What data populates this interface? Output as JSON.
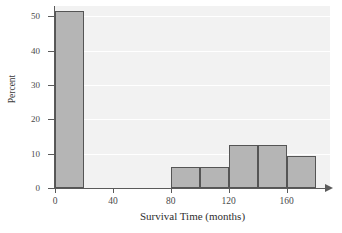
{
  "chart_data": {
    "type": "bar",
    "title": "",
    "xlabel": "Survival Time (months)",
    "ylabel": "Percent",
    "xlim": [
      0,
      190
    ],
    "ylim": [
      0,
      53
    ],
    "grid": true,
    "legend": "none",
    "x_ticks": [
      {
        "value": 0,
        "label": "0"
      },
      {
        "value": 40,
        "label": "40"
      },
      {
        "value": 80,
        "label": "80"
      },
      {
        "value": 120,
        "label": "120"
      },
      {
        "value": 160,
        "label": "160"
      }
    ],
    "y_ticks": [
      {
        "value": 0,
        "label": "0"
      },
      {
        "value": 10,
        "label": "10"
      },
      {
        "value": 20,
        "label": "20"
      },
      {
        "value": 30,
        "label": "30"
      },
      {
        "value": 40,
        "label": "40"
      },
      {
        "value": 50,
        "label": "50"
      }
    ],
    "bin_width": 20,
    "bins": [
      {
        "start": 0,
        "end": 20,
        "value": 51.5
      },
      {
        "start": 80,
        "end": 100,
        "value": 6.2
      },
      {
        "start": 100,
        "end": 120,
        "value": 6.2
      },
      {
        "start": 120,
        "end": 140,
        "value": 12.5
      },
      {
        "start": 140,
        "end": 160,
        "value": 12.5
      },
      {
        "start": 160,
        "end": 180,
        "value": 9.4
      }
    ],
    "categories": [
      "0-20",
      "80-100",
      "100-120",
      "120-140",
      "140-160",
      "160-180"
    ],
    "values": [
      51.5,
      6.2,
      6.2,
      12.5,
      12.5,
      9.4
    ],
    "colors": {
      "bar_fill": "#b5b5b5",
      "bar_border": "#555555",
      "plot_background": "#f2f2f2",
      "gridline": "#ffffff",
      "axis": "#5a5a5a",
      "page_background": "#ffffff"
    }
  }
}
